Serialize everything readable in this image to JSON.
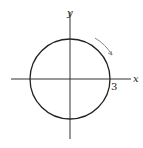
{
  "diagram": {
    "type": "circle-on-axes",
    "axes": {
      "x_label": "x",
      "y_label": "y"
    },
    "circle": {
      "center": [
        0,
        0
      ],
      "radius": 3,
      "radius_label": "3"
    },
    "direction_arrow": "clockwise",
    "colors": {
      "stroke": "#222222",
      "arrow": "#777777"
    }
  }
}
